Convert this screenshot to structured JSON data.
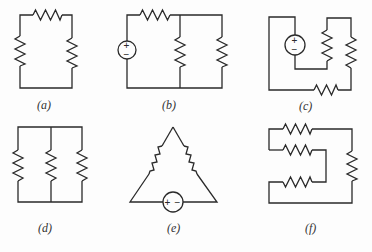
{
  "figure": {
    "colors": {
      "line": "#2a2a2a",
      "background": "#fdfdfd"
    },
    "panels": [
      {
        "id": "a",
        "label": "(a)",
        "components": [
          "resistor-top",
          "resistor-left",
          "resistor-right"
        ]
      },
      {
        "id": "b",
        "label": "(b)",
        "components": [
          "voltage-source",
          "resistor-top",
          "resistor-middle",
          "resistor-right"
        ]
      },
      {
        "id": "c",
        "label": "(c)",
        "components": [
          "voltage-source",
          "resistor-inner",
          "resistor-right",
          "resistor-bottom"
        ]
      },
      {
        "id": "d",
        "label": "(d)",
        "components": [
          "resistor-left",
          "resistor-middle",
          "resistor-right"
        ]
      },
      {
        "id": "e",
        "label": "(e)",
        "components": [
          "resistor-left-slope",
          "resistor-right-slope",
          "voltage-source-bottom"
        ]
      },
      {
        "id": "f",
        "label": "(f)",
        "components": [
          "resistor-top",
          "resistor-second",
          "resistor-third",
          "resistor-right"
        ]
      }
    ],
    "source_signs": {
      "plus": "+",
      "minus": "−"
    }
  }
}
